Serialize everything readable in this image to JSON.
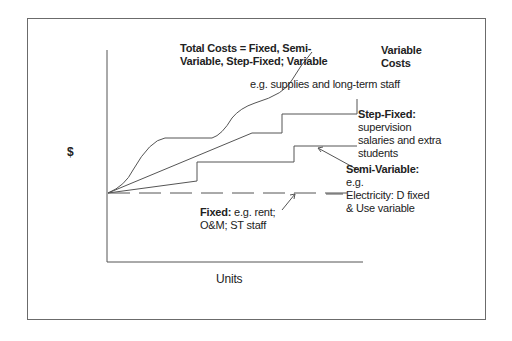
{
  "diagram": {
    "y_axis_label": "$",
    "x_axis_label": "Units",
    "annotations": {
      "total_costs": [
        "Total Costs = Fixed, Semi-",
        "Variable, Step-Fixed; Variable"
      ],
      "variable_costs_title": [
        "Variable",
        "Costs"
      ],
      "variable_costs_example": "e.g. supplies and long-term staff",
      "step_fixed_title": "Step-Fixed:",
      "step_fixed_desc": [
        "supervision",
        "salaries and extra",
        "students"
      ],
      "semi_variable_title": "Semi-Variable:",
      "semi_variable_desc": [
        "e.g.",
        "Electricity: D fixed",
        "& Use variable"
      ],
      "fixed_title": "Fixed:",
      "fixed_desc_1": " e.g. rent;",
      "fixed_desc_2": "O&M;  ST staff"
    },
    "colors": {
      "line": "#555555",
      "frame": "#6b6b6b",
      "text": "#222222"
    }
  }
}
